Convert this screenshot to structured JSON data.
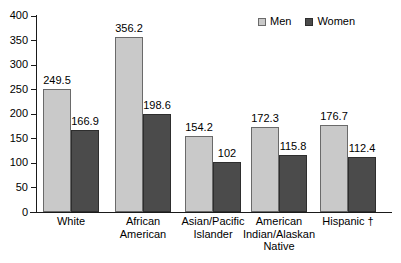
{
  "chart_data": {
    "type": "bar",
    "title": "",
    "subtitle": "",
    "xlabel": "",
    "ylabel": "",
    "ylim": [
      0,
      400
    ],
    "ytick_labels": [
      "400",
      "350",
      "300",
      "250",
      "200",
      "150",
      "100",
      "50",
      "0"
    ],
    "ytick_values": [
      400,
      350,
      300,
      250,
      200,
      150,
      100,
      50,
      0
    ],
    "grid": false,
    "legend_position": "top-right",
    "categories": [
      "White",
      "African American",
      "Asian/Pacific Islander",
      "American Indian/Alaskan Native",
      "Hispanic †"
    ],
    "category_lines": [
      [
        "White"
      ],
      [
        "African",
        "American"
      ],
      [
        "Asian/Pacific",
        "Islander"
      ],
      [
        "American",
        "Indian/Alaskan",
        "Native"
      ],
      [
        "Hispanic †"
      ]
    ],
    "series": [
      {
        "name": "Men",
        "color": "#c9c9c9",
        "values": [
          249.5,
          356.2,
          154.2,
          172.3,
          176.7
        ],
        "labels": [
          "249.5",
          "356.2",
          "154.2",
          "172.3",
          "176.7"
        ]
      },
      {
        "name": "Women",
        "color": "#4b4b4b",
        "values": [
          166.9,
          198.6,
          102,
          115.8,
          112.4
        ],
        "labels": [
          "166.9",
          "198.6",
          "102",
          "115.8",
          "112.4"
        ]
      }
    ],
    "annotations": [
      "†"
    ]
  },
  "legend": {
    "items": [
      {
        "label": "Men",
        "swatch": "men"
      },
      {
        "label": "Women",
        "swatch": "women"
      }
    ]
  }
}
